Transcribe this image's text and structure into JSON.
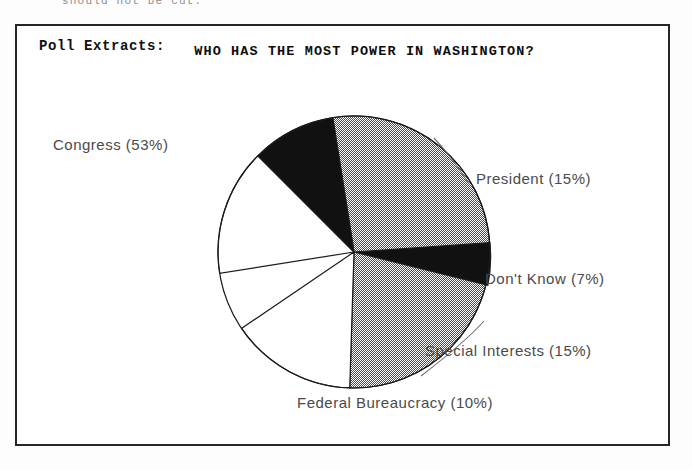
{
  "page": {
    "cropped_top_text": "should not be cut."
  },
  "frame": {
    "section_label": "Poll Extracts:",
    "title": "WHO HAS THE MOST POWER IN WASHINGTON?"
  },
  "colors": {
    "outline": "#1c1c1c",
    "gray_hatch": "#9a9a9a",
    "black_fill": "#111111",
    "white_fill": "#ffffff",
    "label_text": "#4a4a4a",
    "frame_border": "#262626"
  },
  "chart_data": {
    "type": "pie",
    "title": "WHO HAS THE MOST POWER IN WASHINGTON?",
    "xlabel": "",
    "ylabel": "",
    "legend_position": "callout-labels",
    "grid": false,
    "total": 100,
    "units": "percent",
    "categories": [
      "Congress",
      "President",
      "Don't Know",
      "Special Interests",
      "Federal Bureaucracy"
    ],
    "values": [
      53,
      15,
      7,
      15,
      10
    ],
    "labels": [
      "Congress (53%)",
      "President (15%)",
      "Don't Know (7%)",
      "Special Interests (15%)",
      "Federal Bureaucracy (10%)"
    ],
    "slices": [
      {
        "name": "Congress",
        "value": 53,
        "label": "Congress (53%)",
        "fill": "gray-hatch"
      },
      {
        "name": "President",
        "value": 15,
        "label": "President (15%)",
        "fill": "white"
      },
      {
        "name": "Don't Know",
        "value": 7,
        "label": "Don't Know (7%)",
        "fill": "black"
      },
      {
        "name": "Special Interests",
        "value": 15,
        "label": "Special Interests (15%)",
        "fill": "white"
      },
      {
        "name": "Federal Bureaucracy",
        "value": 10,
        "label": "Federal Bureaucracy (10%)",
        "fill": "black"
      }
    ]
  }
}
